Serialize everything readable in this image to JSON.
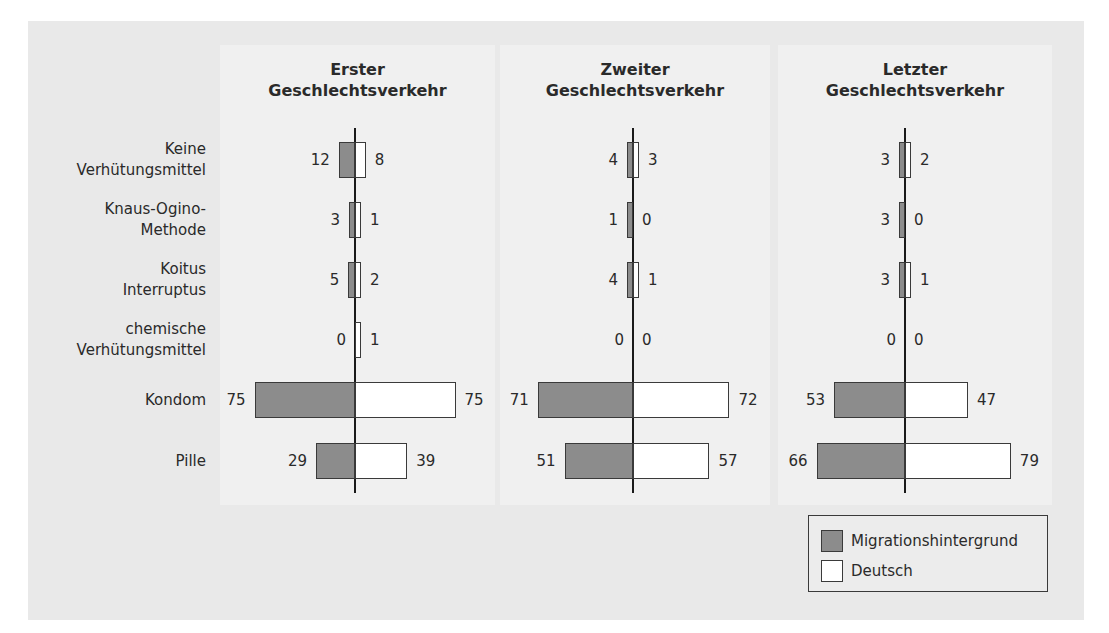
{
  "chart_data": {
    "type": "bar",
    "orientation": "horizontal-diverging",
    "categories": [
      "Keine Verhütungsmittel",
      "Knaus-Ogino-Methode",
      "Koitus Interruptus",
      "chemische Verhütungsmittel",
      "Kondom",
      "Pille"
    ],
    "category_lines": [
      [
        "Keine",
        "Verhütungsmittel"
      ],
      [
        "Knaus-Ogino-",
        "Methode"
      ],
      [
        "Koitus",
        "Interruptus"
      ],
      [
        "chemische",
        "Verhütungsmittel"
      ],
      [
        "Kondom"
      ],
      [
        "Pille"
      ]
    ],
    "panels": [
      {
        "title_lines": [
          "Erster",
          "Geschlechtsverkehr"
        ],
        "series": [
          {
            "name": "Migrationshintergrund",
            "values": [
              12,
              3,
              5,
              0,
              75,
              29
            ]
          },
          {
            "name": "Deutsch",
            "values": [
              8,
              1,
              2,
              1,
              75,
              39
            ]
          }
        ]
      },
      {
        "title_lines": [
          "Zweiter",
          "Geschlechtsverkehr"
        ],
        "series": [
          {
            "name": "Migrationshintergrund",
            "values": [
              4,
              1,
              4,
              0,
              71,
              51
            ]
          },
          {
            "name": "Deutsch",
            "values": [
              3,
              0,
              1,
              0,
              72,
              57
            ]
          }
        ]
      },
      {
        "title_lines": [
          "Letzter",
          "Geschlechtsverkehr"
        ],
        "series": [
          {
            "name": "Migrationshintergrund",
            "values": [
              3,
              3,
              3,
              0,
              53,
              66
            ]
          },
          {
            "name": "Deutsch",
            "values": [
              2,
              0,
              1,
              0,
              47,
              79
            ]
          }
        ]
      }
    ],
    "legend": [
      {
        "name": "Migrationshintergrund",
        "color": "#8c8c8c"
      },
      {
        "name": "Deutsch",
        "color": "#ffffff"
      }
    ],
    "legend_position": "bottom-right",
    "grid": false,
    "xlabel": "",
    "ylabel": ""
  }
}
